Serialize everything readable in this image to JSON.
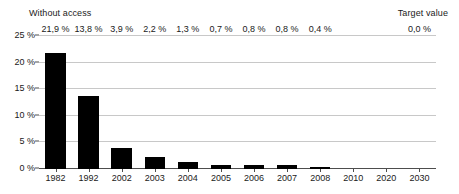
{
  "annotations": {
    "left": "Without access",
    "right": "Target value"
  },
  "chart_data": {
    "type": "bar",
    "title": "",
    "subtitle": "",
    "xlabel": "",
    "ylabel": "",
    "categories": [
      "1982",
      "1992",
      "2002",
      "2003",
      "2004",
      "2005",
      "2006",
      "2007",
      "2008",
      "2010",
      "2020",
      "2030"
    ],
    "values": [
      21.9,
      13.8,
      3.9,
      2.2,
      1.3,
      0.7,
      0.8,
      0.8,
      0.4,
      null,
      null,
      0.0
    ],
    "data_labels": [
      "21,9 %",
      "13,8 %",
      "3,9 %",
      "2,2 %",
      "1,3 %",
      "0,7 %",
      "0,8 %",
      "0,8 %",
      "0,4 %",
      "",
      "",
      "0,0 %"
    ],
    "ylim": [
      0,
      25
    ],
    "yticks": [
      0,
      5,
      10,
      15,
      20,
      25
    ],
    "ytick_labels": [
      "0 %",
      "5 %",
      "10 %",
      "15 %",
      "20 %",
      "25 %"
    ],
    "grid": true,
    "legend": false,
    "bar_color": "#000000",
    "grid_color": "#c8c8c8",
    "axis_color": "#4d4d4d",
    "annotation_left": "Without access",
    "annotation_right": "Target value"
  }
}
